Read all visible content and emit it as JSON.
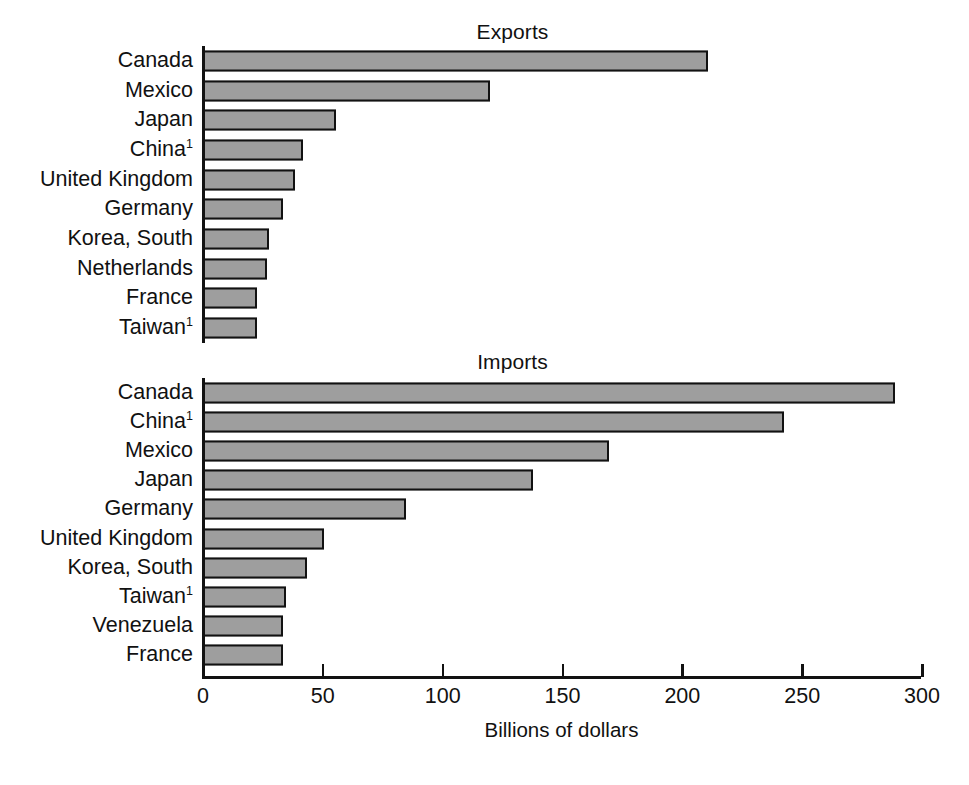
{
  "chart_data": {
    "type": "bar",
    "orientation": "horizontal",
    "title": "",
    "xlabel": "Billions of dollars",
    "ylabel": "",
    "xlim": [
      0,
      300
    ],
    "xticks": [
      0,
      50,
      100,
      150,
      200,
      250,
      300
    ],
    "xtick_labels": [
      "0",
      "50",
      "100",
      "150",
      "200",
      "250",
      "300"
    ],
    "grid": false,
    "legend": null,
    "bar_fill_color": "#9e9e9e",
    "bar_edge_color": "#121212",
    "panels": [
      {
        "title": "Exports",
        "categories": [
          "Canada",
          "Mexico",
          "Japan",
          "China",
          "United Kingdom",
          "Germany",
          "Korea, South",
          "Netherlands",
          "France",
          "Taiwan"
        ],
        "footnote_markers": [
          "",
          "",
          "",
          "1",
          "",
          "",
          "",
          "",
          "",
          "1"
        ],
        "values": [
          211,
          120,
          56,
          42,
          39,
          34,
          28,
          27,
          23,
          23
        ]
      },
      {
        "title": "Imports",
        "categories": [
          "Canada",
          "China",
          "Mexico",
          "Japan",
          "Germany",
          "United Kingdom",
          "Korea, South",
          "Taiwan",
          "Venezuela",
          "France"
        ],
        "footnote_markers": [
          "",
          "1",
          "",
          "",
          "",
          "",
          "",
          "1",
          "",
          ""
        ],
        "values": [
          289,
          243,
          170,
          138,
          85,
          51,
          44,
          35,
          34,
          34
        ]
      }
    ]
  }
}
